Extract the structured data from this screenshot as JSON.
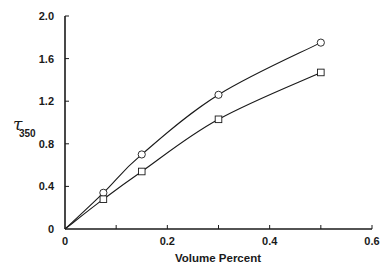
{
  "chart_data": {
    "type": "line",
    "title": "",
    "xlabel": "Volume Percent",
    "ylabel": "τ",
    "ylabel_subscript": "350",
    "xlim": [
      0,
      0.6
    ],
    "ylim": [
      0,
      2.0
    ],
    "xticks": [
      0,
      0.1,
      0.2,
      0.3,
      0.4,
      0.5,
      0.6
    ],
    "xtick_labels": [
      "0",
      "",
      "0.2",
      "",
      "0.4",
      "",
      "0.6"
    ],
    "yticks": [
      0,
      0.4,
      0.8,
      1.2,
      1.6,
      2.0
    ],
    "ytick_labels": [
      "0",
      "0.4",
      "0.8",
      "1.2",
      "1.6",
      "2.0"
    ],
    "grid": false,
    "legend": null,
    "series": [
      {
        "name": "circles",
        "marker": "circle",
        "x": [
          0,
          0.075,
          0.15,
          0.3,
          0.5
        ],
        "y": [
          0,
          0.34,
          0.7,
          1.26,
          1.75
        ],
        "curve_through_origin": true
      },
      {
        "name": "squares",
        "marker": "square",
        "x": [
          0,
          0.075,
          0.15,
          0.3,
          0.5
        ],
        "y": [
          0,
          0.28,
          0.54,
          1.03,
          1.47
        ],
        "curve_through_origin": true
      }
    ]
  },
  "colors": {
    "ink": "#1a1a1a",
    "background": "#ffffff"
  }
}
